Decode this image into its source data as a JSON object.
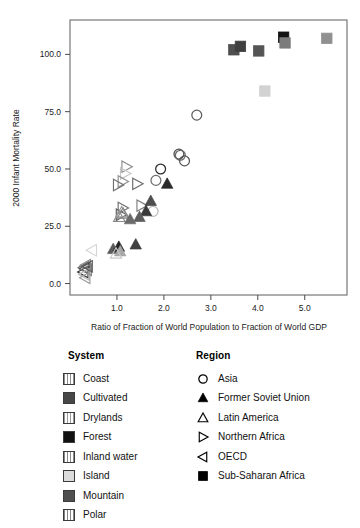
{
  "chart_data": {
    "type": "scatter",
    "title": "",
    "xlabel": "Ratio of Fraction of World Population to Fraction of World GDP",
    "ylabel": "2000 Infant Mortality Rate",
    "xlim": [
      0.0,
      5.9
    ],
    "ylim": [
      -5.0,
      115.0
    ],
    "xticks": [
      "1.0",
      "2.0",
      "3.0",
      "4.0",
      "5.0"
    ],
    "xtick_values": [
      1.0,
      2.0,
      3.0,
      4.0,
      5.0
    ],
    "yticks": [
      "0.0",
      "25.0",
      "50.0",
      "75.0",
      "100.0"
    ],
    "ytick_values": [
      0.0,
      25.0,
      50.0,
      75.0,
      100.0
    ],
    "grid": false,
    "legend_position": "below",
    "marker_size": 5.2,
    "points": [
      {
        "x": 3.49,
        "y": 102.0,
        "region": "Sub-Saharan Africa",
        "system": "Mountain",
        "marker": "square",
        "color": "#4f4f4f"
      },
      {
        "x": 3.63,
        "y": 103.5,
        "region": "Sub-Saharan Africa",
        "system": "Cultivated",
        "marker": "square",
        "color": "#3f3f3f"
      },
      {
        "x": 4.02,
        "y": 101.5,
        "region": "Sub-Saharan Africa",
        "system": "Drylands",
        "marker": "square",
        "color": "#555555"
      },
      {
        "x": 4.55,
        "y": 107.5,
        "region": "Sub-Saharan Africa",
        "system": "Forest",
        "marker": "square",
        "color": "#121212"
      },
      {
        "x": 4.58,
        "y": 105.0,
        "region": "Sub-Saharan Africa",
        "system": "Polar",
        "marker": "square",
        "color": "#7b7b7b"
      },
      {
        "x": 5.47,
        "y": 107.0,
        "region": "Sub-Saharan Africa",
        "system": "Coast",
        "marker": "square",
        "color": "#909090"
      },
      {
        "x": 4.15,
        "y": 84.0,
        "region": "Sub-Saharan Africa",
        "system": "Island",
        "marker": "square",
        "color": "#d2d2d2"
      },
      {
        "x": 2.7,
        "y": 73.5,
        "region": "Asia",
        "system": "Coast",
        "marker": "circle",
        "color": "#5a5a5a"
      },
      {
        "x": 2.32,
        "y": 56.5,
        "region": "Asia",
        "system": "Cultivated",
        "marker": "circle",
        "color": "#4a4a4a"
      },
      {
        "x": 2.35,
        "y": 56.0,
        "region": "Asia",
        "system": "Drylands",
        "marker": "circle",
        "color": "#6a6a6a"
      },
      {
        "x": 2.44,
        "y": 53.5,
        "region": "Asia",
        "system": "Mountain",
        "marker": "circle",
        "color": "#555555"
      },
      {
        "x": 1.93,
        "y": 50.0,
        "region": "Asia",
        "system": "Forest",
        "marker": "circle",
        "color": "#2b2b2b"
      },
      {
        "x": 1.83,
        "y": 45.0,
        "region": "Asia",
        "system": "Inland water",
        "marker": "circle",
        "color": "#6f6f6f"
      },
      {
        "x": 1.77,
        "y": 31.5,
        "region": "Asia",
        "system": "Island",
        "marker": "circle",
        "color": "#b9b9b9"
      },
      {
        "x": 1.2,
        "y": 51.0,
        "region": "Northern Africa",
        "system": "Polar",
        "marker": "triangle-right",
        "color": "#8a8a8a"
      },
      {
        "x": 1.17,
        "y": 48.0,
        "region": "Northern Africa",
        "system": "Island",
        "marker": "triangle-right",
        "color": "#c6c6c6"
      },
      {
        "x": 1.12,
        "y": 44.5,
        "region": "Northern Africa",
        "system": "Coast",
        "marker": "triangle-right",
        "color": "#8f8f8f"
      },
      {
        "x": 1.02,
        "y": 43.0,
        "region": "Northern Africa",
        "system": "Drylands",
        "marker": "triangle-right",
        "color": "#707070"
      },
      {
        "x": 1.43,
        "y": 43.5,
        "region": "Northern Africa",
        "system": "Cultivated",
        "marker": "triangle-right",
        "color": "#6a6a6a"
      },
      {
        "x": 1.52,
        "y": 34.0,
        "region": "Northern Africa",
        "system": "Inland water",
        "marker": "triangle-right",
        "color": "#7d7d7d"
      },
      {
        "x": 1.12,
        "y": 33.0,
        "region": "Northern Africa",
        "system": "Mountain",
        "marker": "triangle-right",
        "color": "#6e6e6e"
      },
      {
        "x": 1.08,
        "y": 30.0,
        "region": "Northern Africa",
        "system": "Forest",
        "marker": "triangle-right",
        "color": "#5c5c5c"
      },
      {
        "x": 1.05,
        "y": 29.0,
        "region": "Latin America",
        "system": "Drylands",
        "marker": "triangle-up-open",
        "color": "#8a8a8a"
      },
      {
        "x": 1.1,
        "y": 31.0,
        "region": "Latin America",
        "system": "Polar",
        "marker": "triangle-up-open",
        "color": "#9a9a9a"
      },
      {
        "x": 1.13,
        "y": 30.5,
        "region": "Latin America",
        "system": "Coast",
        "marker": "triangle-up-open",
        "color": "#878787"
      },
      {
        "x": 1.72,
        "y": 36.0,
        "region": "Former Soviet Union",
        "system": "Mountain",
        "marker": "triangle-up",
        "color": "#4d4d4d"
      },
      {
        "x": 2.07,
        "y": 43.5,
        "region": "Former Soviet Union",
        "system": "Forest",
        "marker": "triangle-up",
        "color": "#2a2a2a"
      },
      {
        "x": 1.62,
        "y": 31.5,
        "region": "Former Soviet Union",
        "system": "Cultivated",
        "marker": "triangle-up",
        "color": "#3a3a3a"
      },
      {
        "x": 1.48,
        "y": 29.0,
        "region": "Former Soviet Union",
        "system": "Drylands",
        "marker": "triangle-up",
        "color": "#5e5e5e"
      },
      {
        "x": 1.28,
        "y": 28.0,
        "region": "Former Soviet Union",
        "system": "Inland water",
        "marker": "triangle-up",
        "color": "#6a6a6a"
      },
      {
        "x": 0.92,
        "y": 15.0,
        "region": "Former Soviet Union",
        "system": "Polar",
        "marker": "triangle-up",
        "color": "#5a5a5a"
      },
      {
        "x": 1.04,
        "y": 16.0,
        "region": "Former Soviet Union",
        "system": "Forest",
        "marker": "triangle-up",
        "color": "#222222"
      },
      {
        "x": 1.07,
        "y": 14.0,
        "region": "Former Soviet Union",
        "system": "Island",
        "marker": "triangle-up",
        "color": "#a8a8a8"
      },
      {
        "x": 1.4,
        "y": 17.0,
        "region": "Former Soviet Union",
        "system": "Cultivated",
        "marker": "triangle-up",
        "color": "#404040"
      },
      {
        "x": 0.3,
        "y": 7.0,
        "region": "OECD",
        "system": "Coast",
        "marker": "triangle-left",
        "color": "#707070"
      },
      {
        "x": 0.32,
        "y": 6.5,
        "region": "OECD",
        "system": "Cultivated",
        "marker": "triangle-left",
        "color": "#4a4a4a"
      },
      {
        "x": 0.34,
        "y": 8.0,
        "region": "OECD",
        "system": "Drylands",
        "marker": "triangle-left",
        "color": "#8a8a8a"
      },
      {
        "x": 0.29,
        "y": 5.0,
        "region": "OECD",
        "system": "Forest",
        "marker": "triangle-left",
        "color": "#2d2d2d"
      },
      {
        "x": 0.36,
        "y": 6.0,
        "region": "OECD",
        "system": "Inland water",
        "marker": "triangle-left",
        "color": "#7a7a7a"
      },
      {
        "x": 0.31,
        "y": 4.0,
        "region": "OECD",
        "system": "Island",
        "marker": "triangle-left",
        "color": "#bbbbbb"
      },
      {
        "x": 0.38,
        "y": 7.5,
        "region": "OECD",
        "system": "Mountain",
        "marker": "triangle-left",
        "color": "#555555"
      },
      {
        "x": 0.33,
        "y": 2.5,
        "region": "OECD",
        "system": "Polar",
        "marker": "triangle-left",
        "color": "#9a9a9a"
      },
      {
        "x": 0.47,
        "y": 14.5,
        "region": "OECD",
        "system": "Island",
        "marker": "triangle-left",
        "color": "#d6d6d6"
      },
      {
        "x": 0.98,
        "y": 13.0,
        "region": "Latin America",
        "system": "Island",
        "marker": "triangle-up-open",
        "color": "#c9c9c9"
      }
    ],
    "legends": [
      {
        "title": "System",
        "key": "system",
        "entries": [
          {
            "label": "Coast",
            "color": "#8d8d8d",
            "pattern": "vstripe"
          },
          {
            "label": "Cultivated",
            "color": "#474747",
            "pattern": "solid"
          },
          {
            "label": "Drylands",
            "color": "#9b9b9b",
            "pattern": "vstripe"
          },
          {
            "label": "Forest",
            "color": "#111111",
            "pattern": "solid"
          },
          {
            "label": "Inland water",
            "color": "#8a8a8a",
            "pattern": "vstripe"
          },
          {
            "label": "Island",
            "color": "#dcdcdc",
            "pattern": "solid"
          },
          {
            "label": "Mountain",
            "color": "#4f4f4f",
            "pattern": "solid"
          },
          {
            "label": "Polar",
            "color": "#858585",
            "pattern": "vstripe"
          }
        ]
      },
      {
        "title": "Region",
        "key": "region",
        "entries": [
          {
            "label": "Asia",
            "marker": "circle"
          },
          {
            "label": "Former Soviet Union",
            "marker": "triangle-up"
          },
          {
            "label": "Latin America",
            "marker": "triangle-up-open"
          },
          {
            "label": "Northern Africa",
            "marker": "triangle-right"
          },
          {
            "label": "OECD",
            "marker": "triangle-left"
          },
          {
            "label": "Sub-Saharan Africa",
            "marker": "square"
          }
        ]
      }
    ]
  }
}
